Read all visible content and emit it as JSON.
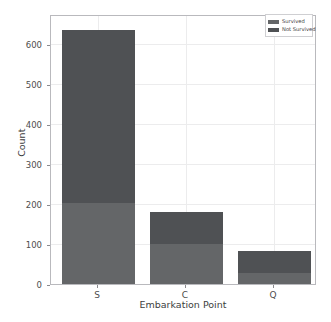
{
  "chart_data": {
    "type": "bar",
    "subtype": "stacked-bar",
    "title": "",
    "xlabel": "Embarkation Point",
    "ylabel": "Count",
    "categories": [
      "S",
      "C",
      "Q"
    ],
    "series": [
      {
        "name": "Survived",
        "color": "#646668",
        "values": [
          202,
          100,
          27
        ]
      },
      {
        "name": "Not Survived",
        "color": "#4f5154",
        "values": [
          433,
          80,
          55
        ]
      }
    ],
    "totals": [
      635,
      180,
      82
    ],
    "ylim": [
      0,
      670
    ],
    "yticks": [
      0,
      100,
      200,
      300,
      400,
      500,
      600
    ],
    "ytick_labels": [
      "0",
      "100",
      "200",
      "300",
      "400",
      "500",
      "600"
    ],
    "xtick_labels": [
      "S",
      "C",
      "Q"
    ],
    "grid": true,
    "grid_color": "#ececed",
    "legend": {
      "position": "upper-right",
      "entries": [
        {
          "label": "Survived",
          "color": "#646668"
        },
        {
          "label": "Not Survived",
          "color": "#4f5154"
        }
      ]
    },
    "axis_color": "#b9b9bd",
    "background": "#ffffff"
  }
}
